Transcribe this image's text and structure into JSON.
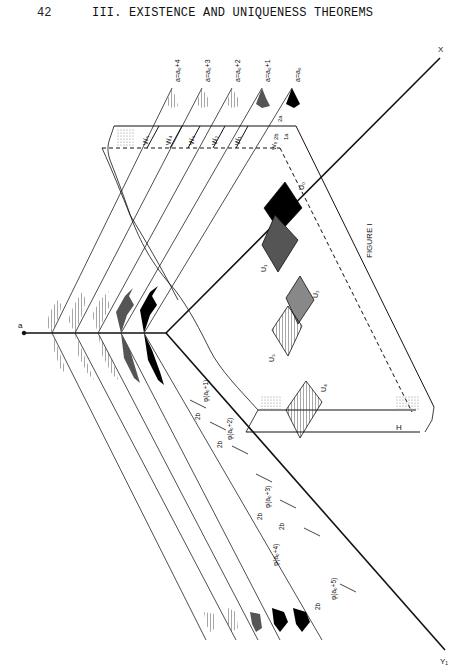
{
  "header": {
    "page_number": "42",
    "running_head": "III.  EXISTENCE AND UNIQUENESS THEOREMS"
  },
  "figure": {
    "caption": "FIGURE I",
    "axis_labels": {
      "origin": "a",
      "x_axis": "X",
      "y_axis": "Y₁",
      "h_label": "H"
    },
    "level_labels": [
      "a=a₀+4",
      "a=a₀+3",
      "a=a₀+2",
      "a=a₀+1",
      "a=a₀"
    ],
    "strip_labels": [
      "W₅",
      "W₄",
      "W₃",
      "W₂",
      "W₁",
      "W₀"
    ],
    "dimension_labels": {
      "two_a": "2a",
      "two_b_short": "2b",
      "one_a": "1a"
    },
    "region_labels": [
      "U₀",
      "U₁",
      "U₂",
      "U₃",
      "U₄"
    ],
    "phi_labels": [
      "φ(a₀+1)",
      "φ(a₀+2)",
      "φ(a₀+3)",
      "φ(a₀+4)",
      "φ(a₀+5)"
    ],
    "interval_label": "2b"
  }
}
